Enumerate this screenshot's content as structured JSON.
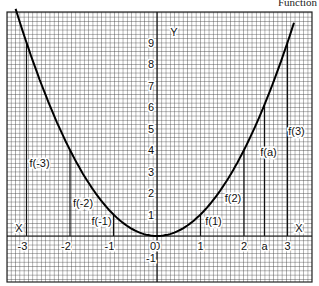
{
  "caption": "Function",
  "axes": {
    "x_label": "X",
    "x_label_left": "X",
    "y_label": "Y",
    "x_ticks": [
      "-3",
      "-2",
      "-1",
      "0",
      "1",
      "2",
      "a",
      "3"
    ],
    "y_ticks": [
      "9",
      "8",
      "7",
      "6",
      "5",
      "4",
      "3",
      "2",
      "1",
      "0",
      "-1"
    ]
  },
  "annotations": [
    "f(-3)",
    "f(-2)",
    "f(-1)",
    "f(1)",
    "f(2)",
    "f(a)",
    "f(3)"
  ],
  "chart_data": {
    "type": "line",
    "xlabel": "X",
    "ylabel": "Y",
    "xlim": [
      -3.4,
      3.5
    ],
    "ylim": [
      -2,
      10
    ],
    "grid": true,
    "series": [
      {
        "name": "f(x) = x^2",
        "x": [
          -3.2,
          -3,
          -2,
          -1,
          0,
          1,
          2,
          2.5,
          3,
          3.1
        ],
        "y": [
          10.24,
          9,
          4,
          1,
          0,
          1,
          4,
          6.25,
          9,
          9.61
        ]
      }
    ],
    "marked_points": [
      {
        "label": "f(-3)",
        "x": -3
      },
      {
        "label": "f(-2)",
        "x": -2
      },
      {
        "label": "f(-1)",
        "x": -1
      },
      {
        "label": "f(1)",
        "x": 1
      },
      {
        "label": "f(2)",
        "x": 2
      },
      {
        "label": "f(a)",
        "x": "a"
      },
      {
        "label": "f(3)",
        "x": 3
      }
    ]
  }
}
